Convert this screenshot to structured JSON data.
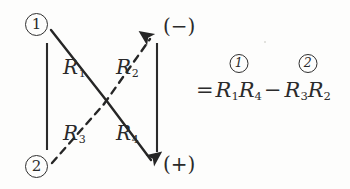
{
  "figure": {
    "background_color": "#fdfdfc",
    "ink_color": "#2a2a2a",
    "nodes": {
      "top_left": "1",
      "bottom_left": "2"
    },
    "terminals": {
      "top_right": "(−)",
      "bottom_right": "(+)"
    },
    "resistors": [
      {
        "id": "R1",
        "letter": "R",
        "subscript": "1"
      },
      {
        "id": "R2",
        "letter": "R",
        "subscript": "2"
      },
      {
        "id": "R3",
        "letter": "R",
        "subscript": "3"
      },
      {
        "id": "R4",
        "letter": "R",
        "subscript": "4"
      }
    ]
  },
  "equation": {
    "equals": "=",
    "minus": "−",
    "term1": {
      "marker": "1",
      "factor_a_letter": "R",
      "factor_a_sub": "1",
      "factor_b_letter": "R",
      "factor_b_sub": "4"
    },
    "term2": {
      "marker": "2",
      "factor_a_letter": "R",
      "factor_a_sub": "3",
      "factor_b_letter": "R",
      "factor_b_sub": "2"
    }
  }
}
